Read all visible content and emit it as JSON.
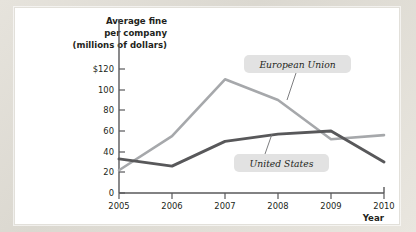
{
  "panel": {
    "background_color": "#ffffff",
    "page_background_color": "#ddd9d2"
  },
  "chart_data": {
    "type": "line",
    "title": "",
    "xlabel": "Year",
    "ylabel": "Average fine per company (millions of dollars)",
    "ylabel_lines": [
      "Average fine",
      "per company",
      "(millions of dollars)"
    ],
    "x": [
      2005,
      2006,
      2007,
      2008,
      2009,
      2010
    ],
    "categories": [
      "2005",
      "2006",
      "2007",
      "2008",
      "2009",
      "2010"
    ],
    "series": [
      {
        "name": "European Union",
        "color": "#a6a8ab",
        "values": [
          22,
          55,
          110,
          90,
          52,
          56
        ]
      },
      {
        "name": "United States",
        "color": "#58585a",
        "values": [
          33,
          26,
          50,
          57,
          60,
          30
        ]
      }
    ],
    "ylim": [
      0,
      126
    ],
    "xlim": [
      2005,
      2010
    ],
    "yticks": [
      0,
      20,
      40,
      60,
      80,
      100,
      120
    ],
    "ytick_labels": [
      "0",
      "20",
      "40",
      "60",
      "80",
      "100",
      "$120"
    ],
    "xticks": [
      2005,
      2006,
      2007,
      2008,
      2009,
      2010
    ],
    "xtick_labels": [
      "2005",
      "2006",
      "2007",
      "2008",
      "2009",
      "2010"
    ],
    "grid": false,
    "legend_position": "inline-callouts",
    "annotations": [
      {
        "text": "European Union",
        "series": "European Union",
        "style": "italic-gray-box"
      },
      {
        "text": "United States",
        "series": "United States",
        "style": "italic-gray-box"
      }
    ]
  },
  "axis": {
    "y_title_line1": "Average fine",
    "y_title_line2": "per company",
    "y_title_line3": "(millions of dollars)",
    "x_title": "Year"
  }
}
